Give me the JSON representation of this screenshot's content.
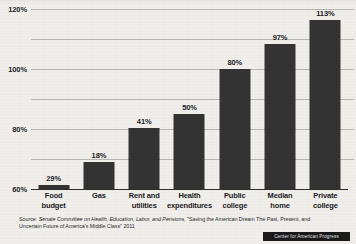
{
  "chart_data": {
    "type": "bar",
    "title": "",
    "xlabel": "",
    "ylabel": "",
    "ylim": [
      0,
      120
    ],
    "ytick_labels": [
      "0",
      "20%",
      "40%",
      "60%",
      "80%",
      "100%",
      "120%"
    ],
    "ytick_values": [
      0,
      20,
      40,
      60,
      80,
      100,
      120
    ],
    "grid": true,
    "legend": "none",
    "categories": [
      "Food budget",
      "Gas",
      "Rent and utilities",
      "Health expenditures",
      "Public college",
      "Median home",
      "Private college"
    ],
    "category_lines": [
      [
        "Food",
        "budget"
      ],
      [
        "Gas",
        ""
      ],
      [
        "Rent and",
        "utilities"
      ],
      [
        "Health",
        "expenditures"
      ],
      [
        "Public",
        "college"
      ],
      [
        "Median",
        "home"
      ],
      [
        "Private",
        "college"
      ]
    ],
    "values": [
      29,
      18,
      41,
      50,
      80,
      97,
      113
    ],
    "value_labels": [
      "29%",
      "18%",
      "41%",
      "50%",
      "80%",
      "97%",
      "113%"
    ],
    "drawn_heights": [
      3,
      18,
      41,
      50,
      80,
      97,
      113
    ],
    "bar_color": "#343434",
    "background_color": "#f1f0ed",
    "gridline_color": "#b9b8b4",
    "axis_color": "#2e2e2e"
  },
  "footer": {
    "source_label": "Source:",
    "source_org": "Senate Committee on Health, Education, Labor, and Pensions,",
    "source_title": "\"Saving the American Dream The Past, Present, and Uncertain Future of America's Middle Class\" 2011",
    "logo_text": "Center for American Progress"
  }
}
